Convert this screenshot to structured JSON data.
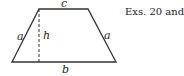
{
  "figure": {
    "caption": "Exs. 20 and 21",
    "shape": "trapezoid",
    "labels": {
      "top": "c",
      "bottom": "b",
      "left": "a",
      "right": "a",
      "height": "h"
    },
    "stroke_color": "#333333"
  }
}
